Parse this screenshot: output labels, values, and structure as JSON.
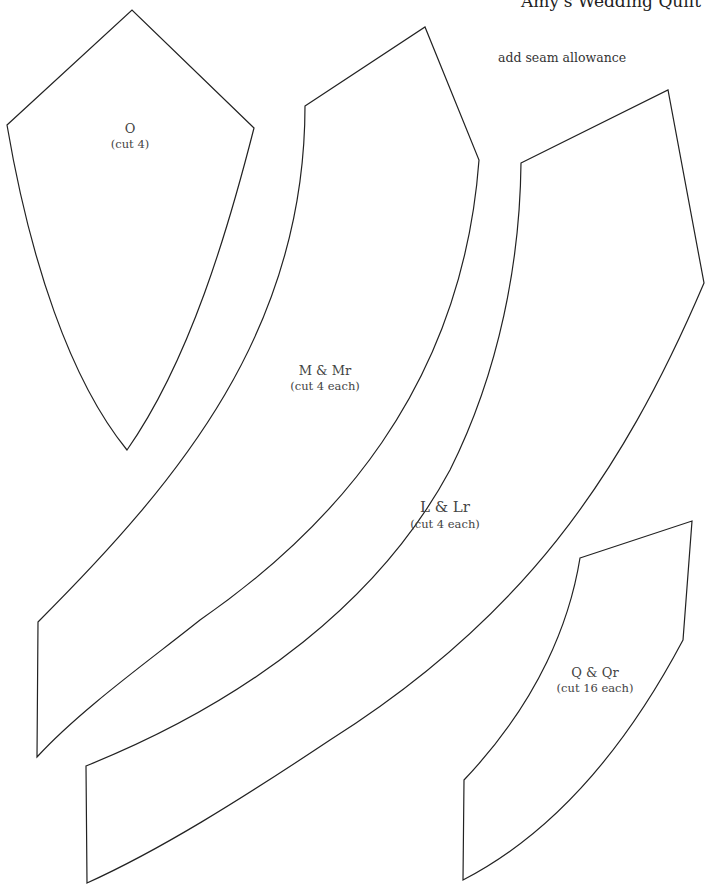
{
  "header": {
    "title": "Amy's Wedding Quilt"
  },
  "note": "add seam allowance",
  "pieces": [
    {
      "id": "O",
      "name": "O",
      "cut": "(cut 4)"
    },
    {
      "id": "M",
      "name": "M & Mr",
      "cut": "(cut 4 each)"
    },
    {
      "id": "L",
      "name": "L & Lr",
      "cut": "(cut 4 each)"
    },
    {
      "id": "Q",
      "name": "Q & Qr",
      "cut": "(cut 16 each)"
    }
  ],
  "colors": {
    "stroke": "#222222",
    "background": "#ffffff"
  }
}
